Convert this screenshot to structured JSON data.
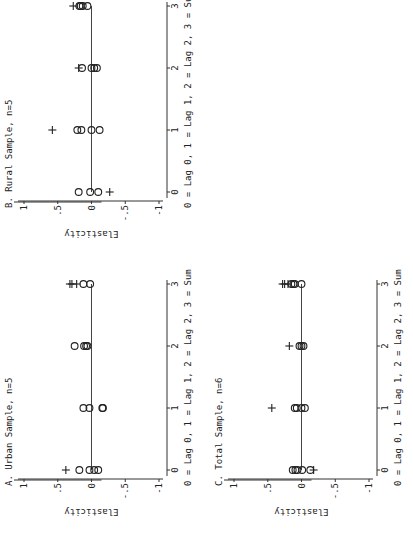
{
  "chart_data": [
    {
      "type": "scatter",
      "id": "B",
      "title": "B. Rural Sample, n=5",
      "xlabel": "0 = Lag 0, 1 = Lag 1, 2 = Lag 2, 3 = Sum",
      "ylabel": "Elasticity",
      "x_ticks": [
        "0",
        "1",
        "2",
        "3"
      ],
      "y_ticks": [
        "1",
        ".5",
        "0",
        "-.5",
        "-1"
      ],
      "y_tick_values": [
        1,
        0.5,
        0,
        -0.5,
        -1
      ],
      "xlim": [
        0,
        3
      ],
      "ylim": [
        -1,
        1
      ],
      "grid": false,
      "reference_line": 0,
      "series": [
        {
          "name": "estimates (circle)",
          "marker": "circle",
          "points": [
            {
              "x": 0,
              "y": 0.19
            },
            {
              "x": 0,
              "y": 0.02
            },
            {
              "x": 0,
              "y": -0.1
            },
            {
              "x": 1,
              "y": 0.21
            },
            {
              "x": 1,
              "y": 0.15
            },
            {
              "x": 1,
              "y": 0.0
            },
            {
              "x": 1,
              "y": -0.12
            },
            {
              "x": 2,
              "y": 0.14
            },
            {
              "x": 2,
              "y": 0.0
            },
            {
              "x": 2,
              "y": -0.04
            },
            {
              "x": 2,
              "y": -0.08
            },
            {
              "x": 3,
              "y": 0.18
            },
            {
              "x": 3,
              "y": 0.16
            },
            {
              "x": 3,
              "y": 0.13
            },
            {
              "x": 3,
              "y": 0.06
            }
          ]
        },
        {
          "name": "estimates (plus)",
          "marker": "plus",
          "points": [
            {
              "x": 0,
              "y": -0.27
            },
            {
              "x": 1,
              "y": 0.58
            },
            {
              "x": 2,
              "y": 0.19
            },
            {
              "x": 3,
              "y": 0.27
            }
          ]
        }
      ]
    },
    {
      "type": "scatter",
      "id": "A",
      "title": "A. Urban Sample, n=5",
      "xlabel": "0 = Lag 0, 1 = Lag 1, 2 = Lag 2, 3 = Sum",
      "ylabel": "Elasticity",
      "x_ticks": [
        "0",
        "1",
        "2",
        "3"
      ],
      "y_ticks": [
        "1",
        ".5",
        "0",
        "-.5",
        "-1"
      ],
      "y_tick_values": [
        1,
        0.5,
        0,
        -0.5,
        -1
      ],
      "xlim": [
        0,
        3
      ],
      "ylim": [
        -1,
        1
      ],
      "grid": false,
      "reference_line": 0,
      "series": [
        {
          "name": "estimates (circle)",
          "marker": "circle",
          "points": [
            {
              "x": 0,
              "y": 0.18
            },
            {
              "x": 0,
              "y": 0.03
            },
            {
              "x": 0,
              "y": -0.04
            },
            {
              "x": 0,
              "y": -0.1
            },
            {
              "x": 1,
              "y": 0.12
            },
            {
              "x": 1,
              "y": 0.03
            },
            {
              "x": 1,
              "y": -0.16
            },
            {
              "x": 1,
              "y": -0.17
            },
            {
              "x": 2,
              "y": 0.25
            },
            {
              "x": 2,
              "y": 0.11
            },
            {
              "x": 2,
              "y": 0.08
            },
            {
              "x": 2,
              "y": 0.06
            },
            {
              "x": 3,
              "y": 0.12
            },
            {
              "x": 3,
              "y": 0.02
            }
          ]
        },
        {
          "name": "estimates (plus)",
          "marker": "plus",
          "points": [
            {
              "x": 0,
              "y": 0.38
            },
            {
              "x": 3,
              "y": 0.32
            },
            {
              "x": 3,
              "y": 0.29
            },
            {
              "x": 3,
              "y": 0.22
            }
          ]
        }
      ]
    },
    {
      "type": "scatter",
      "id": "C",
      "title": "C. Total Sample, n=6",
      "xlabel": "0 = Lag 0, 1 = Lag 1, 2 = Lag 2, 3 = Sum",
      "ylabel": "Elasticity",
      "x_ticks": [
        "0",
        "1",
        "2",
        "3"
      ],
      "y_ticks": [
        "1",
        ".5",
        "0",
        "-.5",
        "-1"
      ],
      "y_tick_values": [
        1,
        0.5,
        0,
        -0.5,
        -1
      ],
      "xlim": [
        0,
        3
      ],
      "ylim": [
        -1,
        1
      ],
      "grid": false,
      "reference_line": 0,
      "series": [
        {
          "name": "estimates (circle)",
          "marker": "circle",
          "points": [
            {
              "x": 0,
              "y": 0.13
            },
            {
              "x": 0,
              "y": 0.09
            },
            {
              "x": 0,
              "y": 0.06
            },
            {
              "x": 0,
              "y": -0.01
            },
            {
              "x": 0,
              "y": -0.13
            },
            {
              "x": 1,
              "y": 0.1
            },
            {
              "x": 1,
              "y": 0.07
            },
            {
              "x": 1,
              "y": 0.0
            },
            {
              "x": 1,
              "y": -0.05
            },
            {
              "x": 2,
              "y": 0.03
            },
            {
              "x": 2,
              "y": 0.0
            },
            {
              "x": 2,
              "y": -0.03
            },
            {
              "x": 3,
              "y": 0.15
            },
            {
              "x": 3,
              "y": 0.12
            },
            {
              "x": 3,
              "y": 0.1
            },
            {
              "x": 3,
              "y": 0.0
            }
          ]
        },
        {
          "name": "estimates (plus)",
          "marker": "plus",
          "points": [
            {
              "x": 0,
              "y": -0.18
            },
            {
              "x": 1,
              "y": 0.44
            },
            {
              "x": 2,
              "y": 0.18
            },
            {
              "x": 3,
              "y": 0.28
            },
            {
              "x": 3,
              "y": 0.25
            },
            {
              "x": 3,
              "y": 0.2
            }
          ]
        }
      ]
    }
  ],
  "figure": {
    "orientation": "rotated 90 degrees counter-clockwise",
    "panels_order": [
      "B",
      "A",
      "C"
    ]
  }
}
